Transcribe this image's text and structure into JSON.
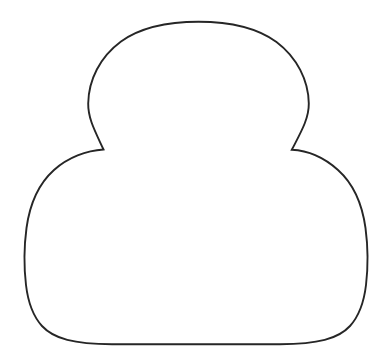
{
  "document": {
    "type": "line-drawing",
    "title": "Outline silhouette of head and body",
    "width": 390,
    "height": 364,
    "background_color": "#FFFFFF",
    "text_content": []
  },
  "drawing": {
    "name": "head-and-body-outline",
    "description": "A closed contour made of two overlapping rounded forms: a smaller upper oval (head) sitting on a larger lower rounded mass (body), joined at two sharp cusps at the shoulders.",
    "stroke_color": "#262626",
    "stroke_width": 1.9,
    "fill_color": "none",
    "shapes": [
      {
        "name": "head-outline",
        "role": "upper-oval",
        "apex": {
          "x": 198,
          "y": 22
        },
        "left_extreme": {
          "x": 88,
          "y": 105
        },
        "right_extreme": {
          "x": 309,
          "y": 105
        },
        "width": 221,
        "height": 128
      },
      {
        "name": "body-outline",
        "role": "lower-rounded-mass",
        "left_extreme": {
          "x": 26,
          "y": 276
        },
        "right_extreme": {
          "x": 367,
          "y": 276
        },
        "bottom": {
          "x": 197,
          "y": 344
        },
        "width": 341,
        "height": 196
      }
    ],
    "cusps": [
      {
        "name": "left-shoulder-cusp",
        "x": 103,
        "y": 150
      },
      {
        "name": "right-shoulder-cusp",
        "x": 292,
        "y": 150
      }
    ],
    "path_d": "M 103.5 149.5 C 95.0 131.0 88.0 118.5 88.2 103.5 C 88.5 80.0 100.0 57.0 121.0 41.5 C 142.0 26.5 169.0 21.8 198.5 21.8 C 228.0 21.8 255.5 26.8 276.5 42.0 C 297.0 57.5 308.5 80.5 308.8 103.5 C 309.0 118.5 301.0 132.0 291.8 149.8 C 307.0 150.5 324.0 157.5 338.0 170.0 C 352.5 183.0 362.0 202.5 365.5 228.0 C 368.5 250.5 368.0 268.0 366.0 285.0 C 364.0 302.0 359.5 315.5 350.0 326.0 C 338.0 339.0 318.0 344.0 280.0 344.3 L 112.0 344.3 C 74.0 344.0 54.0 339.0 42.0 326.0 C 32.5 315.5 28.0 302.0 26.0 285.0 C 24.0 268.0 23.5 250.5 26.5 228.0 C 30.0 202.5 39.5 183.0 54.0 170.0 C 68.0 157.5 86.5 150.5 103.5 149.5 Z"
  }
}
